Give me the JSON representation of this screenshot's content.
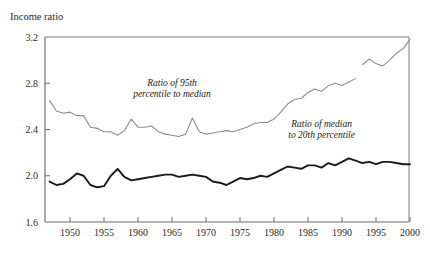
{
  "chart_data": {
    "type": "line",
    "title": "Income ratio",
    "xlabel": "",
    "ylabel": "Income ratio",
    "xlim": [
      1947,
      2000.5
    ],
    "ylim": [
      1.6,
      3.2
    ],
    "yticks": [
      "3.2",
      "2.8",
      "2.4",
      "2.0",
      "1.6"
    ],
    "ytick_values": [
      3.2,
      2.8,
      2.4,
      2.0,
      1.6
    ],
    "xticks": [
      "1950",
      "1955",
      "1960",
      "1965",
      "1970",
      "1975",
      "1980",
      "1985",
      "1990",
      "1995",
      "2000"
    ],
    "xtick_values": [
      1950,
      1955,
      1960,
      1965,
      1970,
      1975,
      1980,
      1985,
      1990,
      1995,
      2000
    ],
    "grid": false,
    "legend_position": "inline-annotations",
    "annotations": [
      {
        "name": "ratio-95th-to-median-label",
        "text_line1": "Ratio of 95th",
        "text_line2": "percentile to median",
        "x": 1965.0,
        "y": 2.78
      },
      {
        "name": "ratio-median-to-20th-label",
        "text_line1": "Ratio of median",
        "text_line2": "to 20th percentile",
        "x": 1987.0,
        "y": 2.42
      }
    ],
    "series": [
      {
        "name": "Ratio of 95th percentile to median",
        "color": "#8c8c8c",
        "width": 1.1,
        "segments": [
          {
            "x": [
              1947,
              1948,
              1949,
              1950,
              1951,
              1952,
              1953,
              1954,
              1955,
              1956,
              1957,
              1958,
              1959,
              1960,
              1961,
              1962,
              1963,
              1964,
              1965,
              1966,
              1967,
              1968,
              1969,
              1970,
              1971,
              1972,
              1973,
              1974,
              1975,
              1976,
              1977,
              1978,
              1979,
              1980,
              1981,
              1982,
              1983,
              1984,
              1985,
              1986,
              1987,
              1988,
              1989,
              1990,
              1991,
              1992
            ],
            "y": [
              2.65,
              2.56,
              2.54,
              2.55,
              2.52,
              2.52,
              2.42,
              2.41,
              2.38,
              2.38,
              2.35,
              2.39,
              2.49,
              2.42,
              2.42,
              2.43,
              2.38,
              2.36,
              2.35,
              2.34,
              2.36,
              2.5,
              2.38,
              2.36,
              2.37,
              2.38,
              2.39,
              2.38,
              2.4,
              2.42,
              2.45,
              2.46,
              2.46,
              2.49,
              2.55,
              2.62,
              2.66,
              2.67,
              2.72,
              2.75,
              2.73,
              2.78,
              2.8,
              2.78,
              2.81,
              2.84
            ]
          },
          {
            "x": [
              1993,
              1994,
              1995,
              1996,
              1997,
              1998,
              1999,
              2000
            ],
            "y": [
              2.96,
              3.01,
              2.97,
              2.95,
              3.0,
              3.06,
              3.1,
              3.18
            ]
          }
        ]
      },
      {
        "name": "Ratio of median to 20th percentile",
        "color": "#1a1a1a",
        "width": 1.9,
        "segments": [
          {
            "x": [
              1947,
              1948,
              1949,
              1950,
              1951,
              1952,
              1953,
              1954,
              1955,
              1956,
              1957,
              1958,
              1959,
              1960,
              1961,
              1962,
              1963,
              1964,
              1965,
              1966,
              1967,
              1968,
              1969,
              1970,
              1971,
              1972,
              1973,
              1974,
              1975,
              1976,
              1977,
              1978,
              1979,
              1980,
              1981,
              1982,
              1983,
              1984,
              1985,
              1986,
              1987,
              1988,
              1989,
              1990,
              1991,
              1992,
              1993,
              1994,
              1995,
              1996,
              1997,
              1998,
              1999,
              2000
            ],
            "y": [
              1.95,
              1.92,
              1.93,
              1.97,
              2.02,
              2.0,
              1.92,
              1.9,
              1.91,
              2.0,
              2.06,
              1.99,
              1.96,
              1.97,
              1.98,
              1.99,
              2.0,
              2.01,
              2.01,
              1.99,
              2.0,
              2.01,
              2.0,
              1.99,
              1.95,
              1.94,
              1.92,
              1.95,
              1.98,
              1.97,
              1.98,
              2.0,
              1.99,
              2.02,
              2.05,
              2.08,
              2.07,
              2.06,
              2.09,
              2.09,
              2.07,
              2.11,
              2.09,
              2.12,
              2.15,
              2.13,
              2.11,
              2.12,
              2.1,
              2.12,
              2.12,
              2.11,
              2.1,
              2.1
            ]
          }
        ]
      }
    ]
  },
  "axes": {
    "y_axis_title": "Income ratio"
  }
}
